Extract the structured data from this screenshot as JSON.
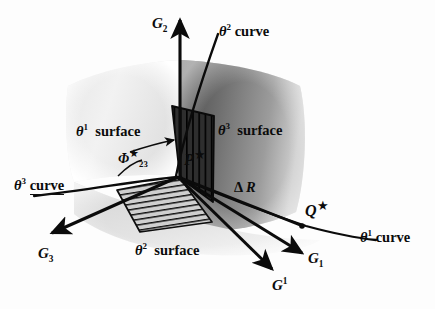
{
  "figure": {
    "background_color": "#fdfdfd",
    "ink_color": "#0b0b0b"
  },
  "surfaces": [
    {
      "id": "theta1-surface",
      "label_base": "θ",
      "label_sup": "1",
      "label_word": "surface",
      "fill_light": "#f1f1f1",
      "fill_dark": "#d4d4d4"
    },
    {
      "id": "theta3-surface",
      "label_base": "θ",
      "label_sup": "3",
      "label_word": "surface",
      "fill_light": "#9a9a9a",
      "fill_dark": "#5d5d5d"
    },
    {
      "id": "theta2-surface",
      "label_base": "θ",
      "label_sup": "2",
      "label_word": "surface",
      "fill_light": "#e8e8e8",
      "fill_dark": "#bdbdbd"
    }
  ],
  "curves": [
    {
      "id": "theta1-curve",
      "label_base": "θ",
      "label_sup": "1",
      "label_word": "curve"
    },
    {
      "id": "theta2-curve",
      "label_base": "θ",
      "label_sup": "2",
      "label_word": "curve"
    },
    {
      "id": "theta3-curve",
      "label_base": "θ",
      "label_sup": "3",
      "label_word": "curve"
    }
  ],
  "axes": [
    {
      "id": "G2",
      "base": "G",
      "sub": "2",
      "sup": ""
    },
    {
      "id": "G3",
      "base": "G",
      "sub": "3",
      "sup": ""
    },
    {
      "id": "G1",
      "base": "G",
      "sub": "1",
      "sup": ""
    },
    {
      "id": "G1-contravariant",
      "base": "G",
      "sub": "",
      "sup": "1"
    }
  ],
  "points": [
    {
      "id": "P-star",
      "base": "P",
      "star": "★"
    },
    {
      "id": "Q-star",
      "base": "Q",
      "star": "★"
    }
  ],
  "angle": {
    "id": "phi-23",
    "base": "Φ",
    "star": "★",
    "sub": "23"
  },
  "increment": {
    "id": "delta-R",
    "delta": "Δ",
    "base": "R"
  },
  "hatch_patches": [
    {
      "id": "floor-patch",
      "orientation": "horizontal-lines"
    },
    {
      "id": "wall-patch",
      "orientation": "vertical-lines"
    }
  ]
}
